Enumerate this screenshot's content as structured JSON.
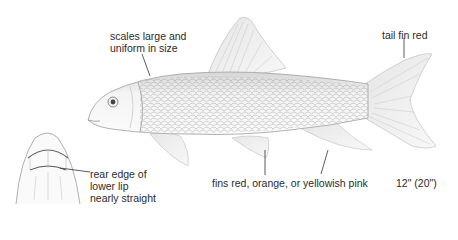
{
  "illustration": {
    "subject": "fish-side-view",
    "inset": "mouth-underside-view"
  },
  "labels": {
    "scales": [
      "scales large and",
      "uniform in size"
    ],
    "tail": "tail fin red",
    "fins": "fins red, orange, or yellowish pink",
    "size": "12\" (20\")",
    "lip": [
      "rear edge of",
      "lower lip",
      "nearly straight"
    ]
  },
  "colors": {
    "ink": "#2b2b2b",
    "pencil": "#8a8a8a",
    "light": "#c8c8c8",
    "background": "#ffffff"
  }
}
